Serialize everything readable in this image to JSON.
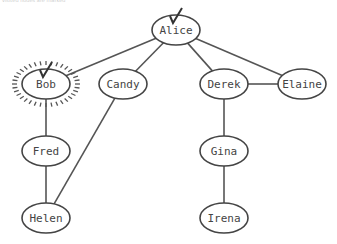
{
  "header": {
    "faint_text": "visited nodes are marked"
  },
  "graph": {
    "nodes": [
      {
        "id": "alice",
        "label": "Alice",
        "x": 176,
        "y": 30,
        "checked": true,
        "highlighted": false
      },
      {
        "id": "bob",
        "label": "Bob",
        "x": 46,
        "y": 84,
        "checked": true,
        "highlighted": true
      },
      {
        "id": "candy",
        "label": "Candy",
        "x": 123,
        "y": 84,
        "checked": false,
        "highlighted": false
      },
      {
        "id": "derek",
        "label": "Derek",
        "x": 224,
        "y": 84,
        "checked": false,
        "highlighted": false
      },
      {
        "id": "elaine",
        "label": "Elaine",
        "x": 302,
        "y": 84,
        "checked": false,
        "highlighted": false
      },
      {
        "id": "fred",
        "label": "Fred",
        "x": 46,
        "y": 151,
        "checked": false,
        "highlighted": false
      },
      {
        "id": "gina",
        "label": "Gina",
        "x": 224,
        "y": 151,
        "checked": false,
        "highlighted": false
      },
      {
        "id": "helen",
        "label": "Helen",
        "x": 46,
        "y": 218,
        "checked": false,
        "highlighted": false
      },
      {
        "id": "irena",
        "label": "Irena",
        "x": 224,
        "y": 218,
        "checked": false,
        "highlighted": false
      }
    ],
    "edges": [
      [
        "alice",
        "bob"
      ],
      [
        "alice",
        "candy"
      ],
      [
        "alice",
        "derek"
      ],
      [
        "alice",
        "elaine"
      ],
      [
        "derek",
        "elaine"
      ],
      [
        "bob",
        "fred"
      ],
      [
        "fred",
        "helen"
      ],
      [
        "candy",
        "helen"
      ],
      [
        "derek",
        "gina"
      ],
      [
        "gina",
        "irena"
      ]
    ],
    "colors": {
      "stroke": "#444444",
      "text": "#444444",
      "edge": "#555555"
    }
  }
}
